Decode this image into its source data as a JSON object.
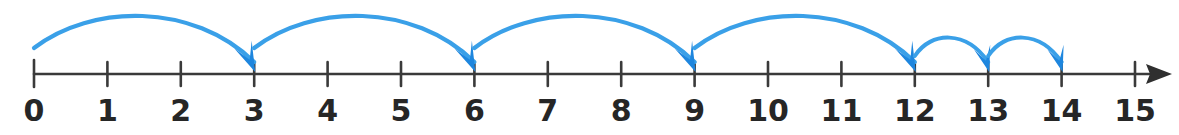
{
  "figure": {
    "background_color": "#ffffff"
  },
  "colors": {
    "axis": "#3a3a3a",
    "label": "#262626",
    "arc": "#3aa0e8",
    "arrow_head": "#1e86de",
    "axis_arrow": "#2f2f2f"
  },
  "chart_data": {
    "type": "line",
    "xlabel": "",
    "ylabel": "",
    "xlim": [
      0,
      15
    ],
    "grid": false,
    "legend": false,
    "axis_ticks": [
      0,
      1,
      2,
      3,
      4,
      5,
      6,
      7,
      8,
      9,
      10,
      11,
      12,
      13,
      14,
      15
    ],
    "tick_labels": [
      "0",
      "1",
      "2",
      "3",
      "4",
      "5",
      "6",
      "7",
      "8",
      "9",
      "10",
      "11",
      "12",
      "13",
      "14",
      "15"
    ],
    "axis_has_right_arrow": true,
    "jumps": [
      {
        "from": 0,
        "to": 3,
        "size": 3,
        "arc": "large"
      },
      {
        "from": 3,
        "to": 6,
        "size": 3,
        "arc": "large"
      },
      {
        "from": 6,
        "to": 9,
        "size": 3,
        "arc": "large"
      },
      {
        "from": 9,
        "to": 12,
        "size": 3,
        "arc": "large"
      },
      {
        "from": 12,
        "to": 13,
        "size": 1,
        "arc": "small"
      },
      {
        "from": 13,
        "to": 14,
        "size": 1,
        "arc": "small"
      }
    ],
    "start_value": 0,
    "end_value": 14,
    "jump_sizes": [
      3,
      3,
      3,
      3,
      1,
      1
    ],
    "landing_points": [
      3,
      6,
      9,
      12,
      13,
      14
    ]
  },
  "geometry": {
    "tick0_x": 34,
    "tick_spacing": 73.4,
    "axis_y": 74,
    "tick_top": 62,
    "tick_bottom": 86,
    "label_baseline_y": 121,
    "axis_arrow_tip_x": 1172,
    "large_arc_peak_y": 8,
    "small_arc_peak_y": 33
  }
}
